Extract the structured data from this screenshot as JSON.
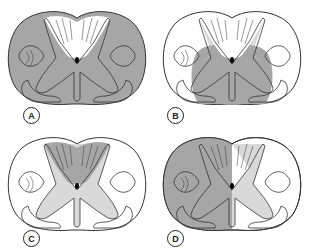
{
  "figure": {
    "colors": {
      "dark_fill": "#a6a6a6",
      "light_fill": "#d9d9d9",
      "white": "#ffffff",
      "outline": "#333333"
    },
    "panels": [
      {
        "id": "A",
        "label": "A",
        "shading": "entire cord dark except dorsal columns"
      },
      {
        "id": "B",
        "label": "B",
        "shading": "central/ventral region dark, lateral dorsal horns light"
      },
      {
        "id": "C",
        "label": "C",
        "shading": "dorsal columns dark, gray matter light"
      },
      {
        "id": "D",
        "label": "D",
        "shading": "left half dark, right gray matter light"
      }
    ]
  }
}
